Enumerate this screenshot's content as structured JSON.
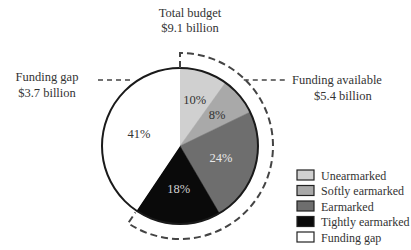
{
  "chart_data": {
    "type": "pie",
    "title": "Total budget",
    "title_value": "$9.1 billion",
    "slices": [
      {
        "name": "Unearmarked",
        "value": 10,
        "label": "10%",
        "color": "#d0d0d0",
        "text_color": "#333333"
      },
      {
        "name": "Softly earmarked",
        "value": 8,
        "label": "8%",
        "color": "#a9a9a9",
        "text_color": "#333333"
      },
      {
        "name": "Earmarked",
        "value": 24,
        "label": "24%",
        "color": "#6e6e6e",
        "text_color": "#e8e8e8"
      },
      {
        "name": "Tightly earmarked",
        "value": 18,
        "label": "18%",
        "color": "#0a0a0a",
        "text_color": "#d0d0d0"
      },
      {
        "name": "Funding gap",
        "value": 41,
        "label": "41%",
        "color": "#ffffff",
        "text_color": "#333333"
      }
    ],
    "annotations": [
      {
        "id": "funding-gap",
        "line1": "Funding gap",
        "line2": "$3.7 billion",
        "side": "left"
      },
      {
        "id": "funding-available",
        "line1": "Funding available",
        "line2": "$5.4 billion",
        "side": "right",
        "spans_slices": [
          "Unearmarked",
          "Softly earmarked",
          "Earmarked",
          "Tightly earmarked"
        ]
      }
    ],
    "legend": {
      "placement": "bottom-right",
      "entries": [
        "Unearmarked",
        "Softly earmarked",
        "Earmarked",
        "Tightly earmarked",
        "Funding gap"
      ]
    }
  }
}
